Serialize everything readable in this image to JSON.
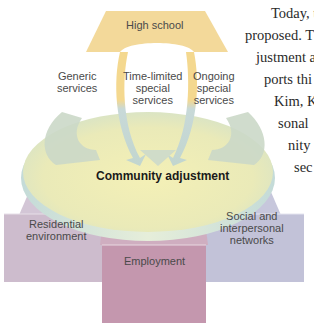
{
  "diagram": {
    "top_box": {
      "label": "High school",
      "color": "#f3d99a"
    },
    "services": [
      {
        "label_line1": "Generic",
        "label_line2": "services",
        "label_line3": ""
      },
      {
        "label_line1": "Time-limited",
        "label_line2": "special",
        "label_line3": "services"
      },
      {
        "label_line1": "Ongoing",
        "label_line2": "special",
        "label_line3": "services"
      }
    ],
    "platform": {
      "label": "Community adjustment",
      "color_top": "#f0ecb8",
      "color_edge": "#c9dcd6"
    },
    "pillars": [
      {
        "label_line1": "Residential",
        "label_line2": "environment",
        "label_line3": "",
        "color": "#cdbccd"
      },
      {
        "label_line1": "Employment",
        "label_line2": "",
        "label_line3": "",
        "color": "#c497ae"
      },
      {
        "label_line1": "Social and",
        "label_line2": "interpersonal",
        "label_line3": "networks",
        "color": "#c2c2d8"
      }
    ],
    "arrow_colors": {
      "top": "#f2d493",
      "bottom": "#c7d8d6"
    }
  },
  "side_text": {
    "lines": [
      "Today, t",
      "proposed. T",
      "justment a",
      "ports thi",
      "Kim, K",
      "sonal",
      "nity",
      "sec"
    ]
  }
}
